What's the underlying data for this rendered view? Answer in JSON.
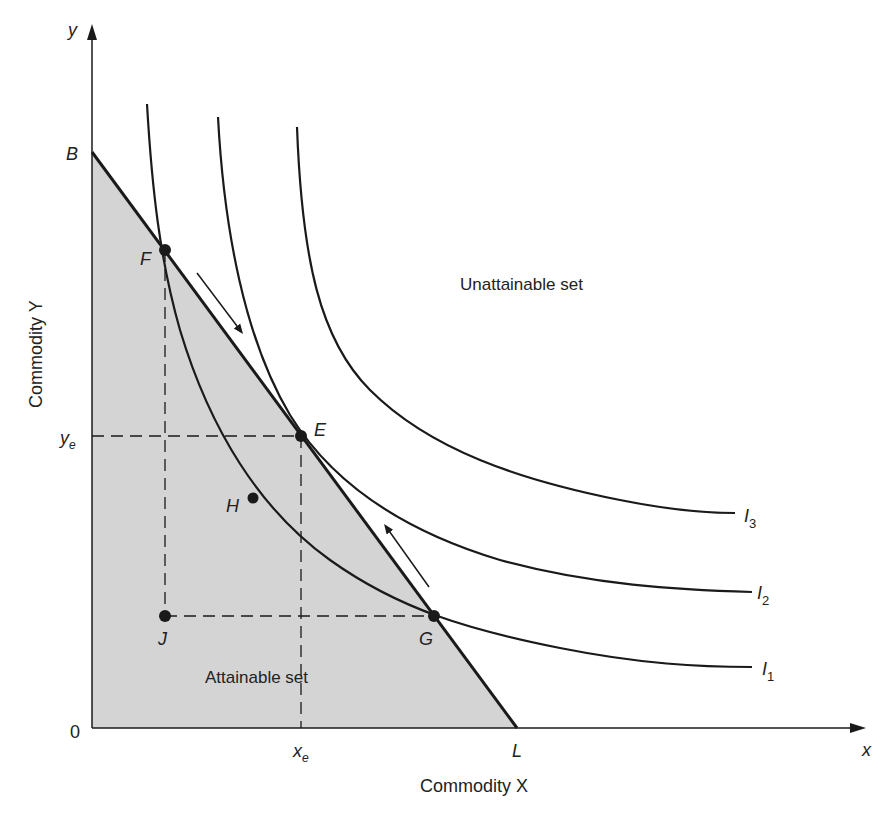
{
  "axes": {
    "y_label": "y",
    "x_label": "x",
    "y_title": "Commodity Y",
    "x_title": "Commodity X",
    "origin_label": "0"
  },
  "points": {
    "B": "B",
    "L": "L",
    "F": "F",
    "E": "E",
    "H": "H",
    "G": "G",
    "J": "J"
  },
  "ticks": {
    "x_e": "x",
    "x_e_sub": "e",
    "y_e": "y",
    "y_e_sub": "e"
  },
  "curves": [
    {
      "name": "I",
      "sub": "1"
    },
    {
      "name": "I",
      "sub": "2"
    },
    {
      "name": "I",
      "sub": "3"
    }
  ],
  "regions": {
    "attainable": "Attainable set",
    "unattainable": "Unattainable set"
  },
  "colors": {
    "shade": "#d4d4d4",
    "ink": "#1a1a1a"
  }
}
